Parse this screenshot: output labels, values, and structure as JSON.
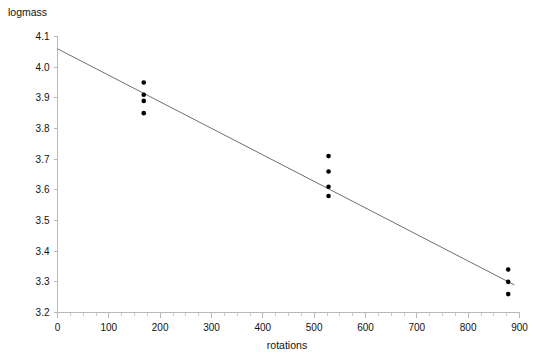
{
  "chart_data": {
    "type": "scatter",
    "title": "",
    "xlabel": "rotations",
    "ylabel": "logmass",
    "xlim": [
      0,
      900
    ],
    "ylim": [
      3.2,
      4.1
    ],
    "grid": false,
    "legend": null,
    "x_ticks": [
      0,
      100,
      200,
      300,
      400,
      500,
      600,
      700,
      800,
      900
    ],
    "x_tick_labels": [
      "0",
      "100",
      "200",
      "300",
      "400",
      "500",
      "600",
      "700",
      "800",
      "900"
    ],
    "x_minor_tick_step": 25,
    "y_ticks": [
      3.2,
      3.3,
      3.4,
      3.5,
      3.6,
      3.7,
      3.8,
      3.9,
      4.0,
      4.1
    ],
    "y_tick_labels": [
      "3.2",
      "3.3",
      "3.4",
      "3.5",
      "3.6",
      "3.7",
      "3.8",
      "3.9",
      "4.0",
      "4.1"
    ],
    "points": [
      {
        "x": 168,
        "y": 3.95
      },
      {
        "x": 168,
        "y": 3.91
      },
      {
        "x": 168,
        "y": 3.89
      },
      {
        "x": 168,
        "y": 3.85
      },
      {
        "x": 528,
        "y": 3.71
      },
      {
        "x": 528,
        "y": 3.66
      },
      {
        "x": 528,
        "y": 3.61
      },
      {
        "x": 528,
        "y": 3.58
      },
      {
        "x": 878,
        "y": 3.34
      },
      {
        "x": 878,
        "y": 3.3
      },
      {
        "x": 878,
        "y": 3.26
      }
    ],
    "point_color": "#000000",
    "point_radius": 2.3,
    "fit_line": {
      "type": "linear",
      "x_start": 0,
      "y_start": 4.06,
      "x_end": 890,
      "y_end": 3.29,
      "color": "#6f6f6f"
    },
    "axis_color": "#b9b9b9"
  }
}
